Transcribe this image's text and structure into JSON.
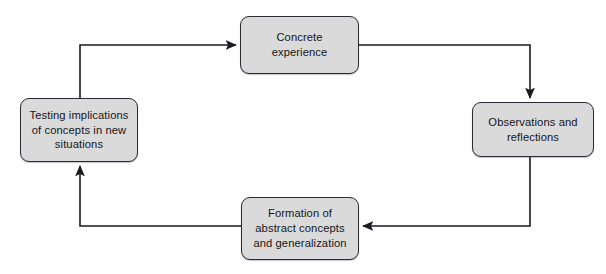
{
  "diagram": {
    "type": "cycle-flowchart",
    "background_color": "#ffffff",
    "node_fill_color": "#dadada",
    "node_border_color": "#2b2b33",
    "edge_color": "#1a1a22",
    "text_color": "#15151a",
    "nodes": [
      {
        "id": "concrete-experience",
        "label": "Concrete\nexperience",
        "lines": [
          "Concrete",
          "experience"
        ],
        "position": "top"
      },
      {
        "id": "observations-reflections",
        "label": "Observations and\nreflections",
        "lines": [
          "Observations and",
          "reflections"
        ],
        "position": "right"
      },
      {
        "id": "formation-abstract-concepts",
        "label": "Formation of\nabstract concepts\nand generalization",
        "lines": [
          "Formation of",
          "abstract concepts",
          "and generalization"
        ],
        "position": "bottom"
      },
      {
        "id": "testing-implications",
        "label": "Testing implications\nof concepts in new\nsituations",
        "lines": [
          "Testing implications",
          "of concepts in new",
          "situations"
        ],
        "position": "left"
      }
    ],
    "edges": [
      {
        "id": "testing-to-concrete",
        "from": "testing-implications",
        "to": "concrete-experience",
        "direction": "up-then-right",
        "arrowhead": "at-target"
      },
      {
        "id": "concrete-to-observations",
        "from": "concrete-experience",
        "to": "observations-reflections",
        "direction": "right-then-down",
        "arrowhead": "at-target"
      },
      {
        "id": "observations-to-formation",
        "from": "observations-reflections",
        "to": "formation-abstract-concepts",
        "direction": "down-then-left",
        "arrowhead": "at-target"
      },
      {
        "id": "formation-to-testing",
        "from": "formation-abstract-concepts",
        "to": "testing-implications",
        "direction": "left-then-up",
        "arrowhead": "at-target"
      }
    ]
  }
}
